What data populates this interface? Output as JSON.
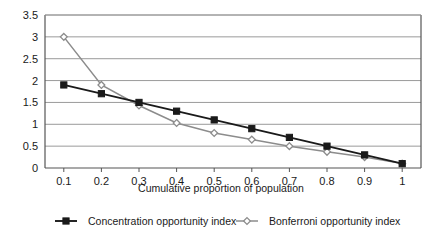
{
  "chart_data": {
    "type": "line",
    "title": "",
    "xlabel": "Cumulative proportion of population",
    "ylabel": "",
    "x": [
      0.1,
      0.2,
      0.3,
      0.4,
      0.5,
      0.6,
      0.7,
      0.8,
      0.9,
      1
    ],
    "xtick_labels": [
      "0.1",
      "0.2",
      "0.3",
      "0.4",
      "0.5",
      "0.6",
      "0.7",
      "0.8",
      "0.9",
      "1"
    ],
    "ytick_labels": [
      "0",
      "0.5",
      "1",
      "1.5",
      "2",
      "2.5",
      "3",
      "3.5"
    ],
    "yticks": [
      0,
      0.5,
      1,
      1.5,
      2,
      2.5,
      3,
      3.5
    ],
    "ylim": [
      0,
      3.5
    ],
    "xlim": [
      0.05,
      1.05
    ],
    "grid": "horizontal",
    "legend_position": "bottom",
    "series": [
      {
        "name": "Concentration opportunity index",
        "marker": "square",
        "color": "#1a1a1a",
        "values": [
          1.9,
          1.7,
          1.5,
          1.3,
          1.1,
          0.9,
          0.7,
          0.5,
          0.3,
          0.1
        ]
      },
      {
        "name": "Bonferroni opportunity index",
        "marker": "diamond",
        "color": "#8c8c8c",
        "values": [
          3.0,
          1.9,
          1.43,
          1.03,
          0.8,
          0.65,
          0.5,
          0.37,
          0.25,
          0.1
        ]
      }
    ]
  },
  "colors": {
    "series_1": "#1a1a1a",
    "series_2": "#8c8c8c",
    "gridline": "#9a9a9a",
    "frame": "#555555",
    "background": "#ffffff"
  }
}
